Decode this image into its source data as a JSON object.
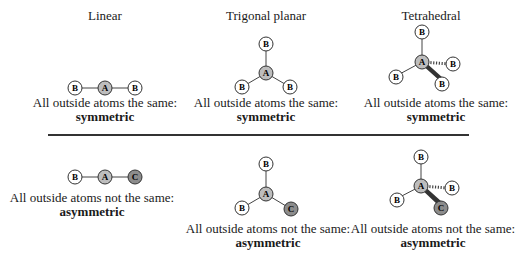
{
  "columns": [
    {
      "title": "Linear"
    },
    {
      "title": "Trigonal planar"
    },
    {
      "title": "Tetrahedral"
    }
  ],
  "rows": {
    "symmetric": {
      "caption": "All outside atoms the same:",
      "kind": "symmetric",
      "molecules": {
        "linear": {
          "center": "A",
          "outer": [
            "B",
            "B"
          ]
        },
        "trigonal_planar": {
          "center": "A",
          "outer": [
            "B",
            "B",
            "B"
          ]
        },
        "tetrahedral": {
          "center": "A",
          "outer": [
            "B",
            "B",
            "B",
            "B"
          ]
        }
      }
    },
    "asymmetric": {
      "caption": "All outside atoms not the same:",
      "kind": "asymmetric",
      "molecules": {
        "linear": {
          "center": "A",
          "outer": [
            "B",
            "C"
          ]
        },
        "trigonal_planar": {
          "center": "A",
          "outer": [
            "B",
            "B",
            "C"
          ]
        },
        "tetrahedral": {
          "center": "A",
          "outer": [
            "B",
            "B",
            "B",
            "C"
          ]
        }
      }
    }
  },
  "colors": {
    "atom_B_fill": "#ffffff",
    "atom_A_fill": "#bdbdbd",
    "atom_C_fill": "#8c8c8c",
    "bond": "#444444"
  }
}
